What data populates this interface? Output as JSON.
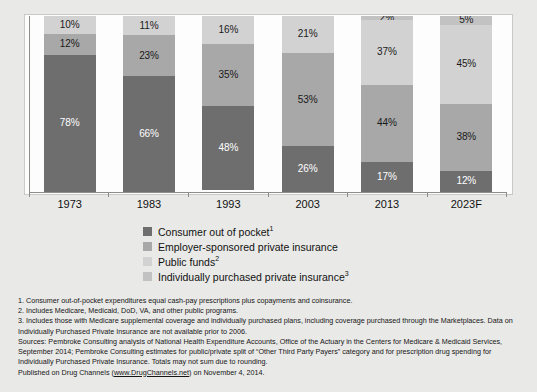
{
  "chart_data": {
    "type": "bar",
    "subtype": "stacked-100-percent",
    "title": "",
    "xlabel": "",
    "ylabel": "",
    "ylim": [
      0,
      100
    ],
    "grid": false,
    "legend_position": "below-plot-center",
    "categories": [
      "1973",
      "1983",
      "1993",
      "2003",
      "2013",
      "2023F"
    ],
    "series": [
      {
        "name": "Consumer out of pocket",
        "color": "#6e6e6e",
        "values": [
          78,
          66,
          48,
          26,
          17,
          12
        ],
        "labels": [
          "78%",
          "66%",
          "48%",
          "26%",
          "17%",
          "12%"
        ]
      },
      {
        "name": "Employer-sponsored private insurance",
        "color": "#a8a8a8",
        "values": [
          12,
          23,
          35,
          53,
          44,
          38
        ],
        "labels": [
          "12%",
          "23%",
          "35%",
          "53%",
          "44%",
          "38%"
        ]
      },
      {
        "name": "Public funds",
        "color": "#d2d2d2",
        "values": [
          10,
          11,
          16,
          21,
          37,
          45
        ],
        "labels": [
          "10%",
          "11%",
          "16%",
          "21%",
          "37%",
          "45%"
        ]
      },
      {
        "name": "Individually purchased private insurance",
        "color": "#c2c2c2",
        "values": [
          0,
          0,
          0,
          0,
          2,
          5
        ],
        "labels": [
          "",
          "",
          "",
          "",
          "2%",
          "5%"
        ]
      }
    ]
  },
  "legend": {
    "items": [
      {
        "label": "Consumer out of pocket",
        "footnote": "1",
        "color": "#6e6e6e"
      },
      {
        "label": "Employer-sponsored private insurance",
        "footnote": "",
        "color": "#a8a8a8"
      },
      {
        "label": "Public funds",
        "footnote": "2",
        "color": "#d2d2d2"
      },
      {
        "label": "Individually purchased private insurance",
        "footnote": "3",
        "color": "#c2c2c2"
      }
    ]
  },
  "notes": {
    "line1": "1. Consumer out-of-pocket expenditures equal cash-pay prescriptions plus copayments and coinsurance.",
    "line2": "2. Includes Medicare, Medicaid, DoD, VA, and other public programs.",
    "line3": "3. Includes those with Medicare supplemental coverage and individually purchased plans, including coverage purchased through the Marketplaces. Data on Individually Purchased Private Insurance are not available prior to 2006.",
    "line4": "Sources: Pembroke Consulting analysis of National Health Expenditure Accounts, Office of the Actuary in the Centers for Medicare & Medicaid Services, September 2014; Pembroke Consulting estimates for public/private split of “Other Third Party Payers” category and for prescription drug spending for Individually Purchased Private Insurance. Totals may not sum due to rounding.",
    "published_prefix": "Published on Drug Channels (",
    "published_link": "www.DrugChannels.net",
    "published_suffix": ") on November 4, 2014."
  }
}
